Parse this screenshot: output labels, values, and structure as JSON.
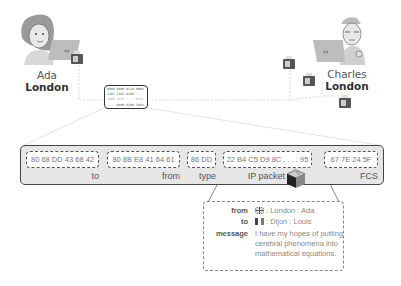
{
  "people": {
    "sender": {
      "name": "Ada",
      "city": "London"
    },
    "receiver": {
      "name": "Charles",
      "city": "London"
    }
  },
  "binary_box": {
    "lines": [
      "0000 0000 0110 0000",
      "1101 1101 0100 ....",
      "1000 1019 .... 0101",
      ".... 0000 0100 1010"
    ]
  },
  "frame": {
    "fields": [
      {
        "value": "80 68 DD 43 68 42",
        "label": "to"
      },
      {
        "value": "80 8B E8 41 64 61",
        "label": "from"
      },
      {
        "value": "86 DD",
        "label": "type"
      },
      {
        "value": "22 B4 C5 D9 8C . . . . 95",
        "label": "IP packet"
      },
      {
        "value": "67 7E 24 5F",
        "label": "FCS"
      }
    ]
  },
  "packet_detail": {
    "from": {
      "key": "from",
      "flag": "uk-flag-icon",
      "value": ": London : Ada"
    },
    "to": {
      "key": "to",
      "flag": "france-flag-icon",
      "value": ": Dijon : Louis"
    },
    "message": {
      "key": "message",
      "value": "I have my hopes of putting cerebral phenomena into mathematical equations."
    }
  },
  "colors": {
    "frame_bg": "#e6e6e6",
    "frame_border": "#444444",
    "line": "#d8d8d8",
    "text": "#555555"
  }
}
